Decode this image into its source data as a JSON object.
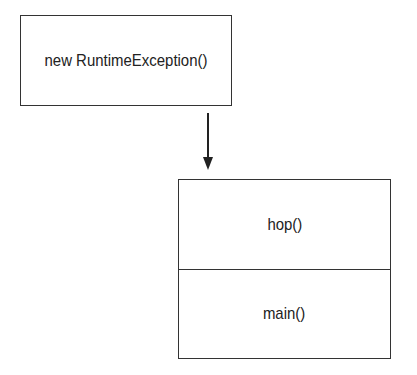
{
  "diagram": {
    "exception_box": {
      "label": "new RuntimeException()"
    },
    "call_stack": {
      "frames": [
        {
          "label": "hop()"
        },
        {
          "label": "main()"
        }
      ]
    },
    "arrow": {
      "from": "exception_box",
      "to": "call_stack",
      "direction": "down"
    }
  }
}
